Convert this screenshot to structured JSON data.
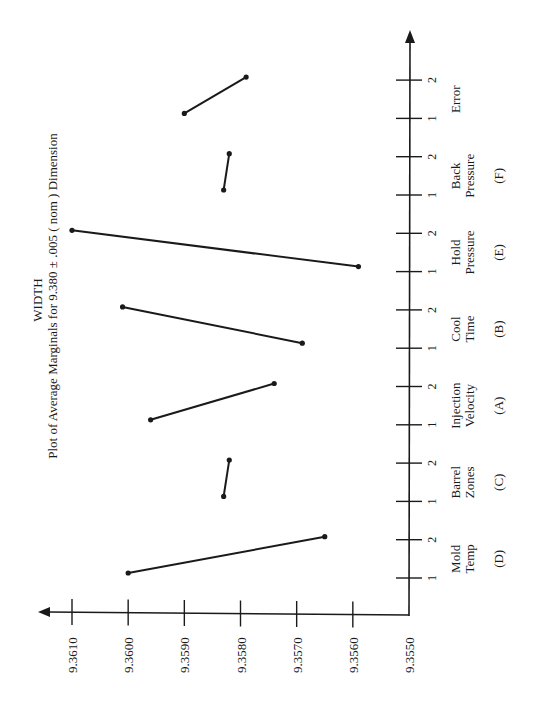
{
  "chart_data": {
    "type": "line",
    "orientation": "rotated-90-ccw",
    "title": "WIDTH",
    "subtitle": "Plot of Average Marginals for 9.380 ± .005 ( nom ) Dimension",
    "xlabel": "",
    "ylabel": "",
    "ylim": [
      9.355,
      9.361
    ],
    "y_ticks": [
      "9.3610",
      "9.3600",
      "9.3590",
      "9.3580",
      "9.3570",
      "9.3560",
      "9.3550"
    ],
    "grid": false,
    "legend": null,
    "factors": [
      {
        "name_line1": "Mold",
        "name_line2": "Temp",
        "code": "(D)",
        "levels": [
          "1",
          "2"
        ],
        "values": [
          9.36,
          9.3565
        ]
      },
      {
        "name_line1": "Barrel",
        "name_line2": "Zones",
        "code": "(C)",
        "levels": [
          "1",
          "2"
        ],
        "values": [
          9.3583,
          9.3582
        ]
      },
      {
        "name_line1": "Injection",
        "name_line2": "Velocity",
        "code": "(A)",
        "levels": [
          "1",
          "2"
        ],
        "values": [
          9.3596,
          9.3574
        ]
      },
      {
        "name_line1": "Cool",
        "name_line2": "Time",
        "code": "(B)",
        "levels": [
          "1",
          "2"
        ],
        "values": [
          9.3569,
          9.3601
        ]
      },
      {
        "name_line1": "Hold",
        "name_line2": "Pressure",
        "code": "(E)",
        "levels": [
          "1",
          "2"
        ],
        "values": [
          9.3559,
          9.361
        ]
      },
      {
        "name_line1": "Back",
        "name_line2": "Pressure",
        "code": "(F)",
        "levels": [
          "1",
          "2"
        ],
        "values": [
          9.3583,
          9.3582
        ]
      },
      {
        "name_line1": "Error",
        "name_line2": "",
        "code": "",
        "levels": [
          "1",
          "2"
        ],
        "values": [
          9.359,
          9.3579
        ]
      }
    ]
  },
  "colors": {
    "ink": "#1a1a1a",
    "background": "#ffffff"
  }
}
